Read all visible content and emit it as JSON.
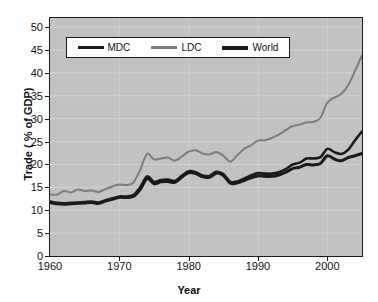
{
  "chart_data": {
    "type": "line",
    "title": "",
    "xlabel": "Year",
    "ylabel": "Trade ( % of GDP)",
    "xlim": [
      1960,
      2005
    ],
    "ylim": [
      0,
      52
    ],
    "grid": true,
    "legend_position": "top-center-inside",
    "x_ticks": [
      "1960",
      "1970",
      "1980",
      "1990",
      "2000"
    ],
    "x_tick_values": [
      1960,
      1970,
      1980,
      1990,
      2000
    ],
    "y_ticks": [
      "0",
      "5",
      "10",
      "15",
      "20",
      "25",
      "30",
      "35",
      "40",
      "45",
      "50"
    ],
    "y_tick_values": [
      0,
      5,
      10,
      15,
      20,
      25,
      30,
      35,
      40,
      45,
      50
    ],
    "x": [
      1960,
      1961,
      1962,
      1963,
      1964,
      1965,
      1966,
      1967,
      1968,
      1969,
      1970,
      1971,
      1972,
      1973,
      1974,
      1975,
      1976,
      1977,
      1978,
      1979,
      1980,
      1981,
      1982,
      1983,
      1984,
      1985,
      1986,
      1987,
      1988,
      1989,
      1990,
      1991,
      1992,
      1993,
      1994,
      1995,
      1996,
      1997,
      1998,
      1999,
      2000,
      2001,
      2002,
      2003,
      2004,
      2005
    ],
    "series": [
      {
        "name": "MDC",
        "color": "#1a1a1a",
        "values": [
          11.9,
          11.6,
          11.5,
          11.6,
          11.7,
          11.8,
          11.9,
          11.7,
          12.2,
          12.6,
          13.0,
          13.0,
          13.3,
          15.0,
          17.4,
          16.2,
          16.6,
          16.7,
          16.4,
          17.5,
          18.5,
          18.3,
          17.6,
          17.5,
          18.4,
          17.9,
          16.2,
          16.3,
          16.9,
          17.6,
          18.1,
          18.0,
          18.0,
          18.3,
          19.0,
          20.0,
          20.4,
          21.3,
          21.3,
          21.6,
          23.4,
          22.7,
          22.3,
          23.2,
          25.3,
          27.2
        ]
      },
      {
        "name": "LDC",
        "color": "#7d7d7d",
        "values": [
          13.5,
          13.4,
          14.2,
          13.9,
          14.5,
          14.2,
          14.3,
          14.0,
          14.6,
          15.2,
          15.6,
          15.5,
          16.0,
          18.8,
          22.3,
          21.1,
          21.3,
          21.5,
          20.8,
          21.7,
          22.8,
          23.1,
          22.4,
          22.2,
          22.7,
          21.9,
          20.6,
          22.0,
          23.4,
          24.2,
          25.2,
          25.3,
          25.8,
          26.5,
          27.5,
          28.4,
          28.7,
          29.2,
          29.3,
          30.2,
          33.5,
          34.6,
          35.4,
          37.3,
          40.5,
          43.8
        ]
      },
      {
        "name": "World",
        "color": "#1a1a1a",
        "values": [
          11.7,
          11.4,
          11.3,
          11.4,
          11.5,
          11.6,
          11.7,
          11.5,
          12.0,
          12.4,
          12.8,
          12.8,
          13.0,
          14.5,
          16.9,
          15.8,
          16.2,
          16.3,
          16.1,
          17.2,
          18.2,
          18.0,
          17.3,
          17.2,
          18.1,
          17.6,
          15.9,
          16.0,
          16.5,
          17.1,
          17.5,
          17.4,
          17.4,
          17.7,
          18.3,
          19.1,
          19.4,
          20.0,
          19.9,
          20.2,
          21.9,
          21.2,
          20.8,
          21.5,
          21.9,
          22.4
        ]
      }
    ]
  },
  "legend": {
    "items": [
      {
        "label": "MDC",
        "color": "#1a1a1a"
      },
      {
        "label": "LDC",
        "color": "#7d7d7d"
      },
      {
        "label": "World",
        "color": "#1a1a1a"
      }
    ]
  }
}
